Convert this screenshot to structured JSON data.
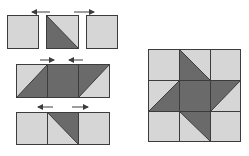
{
  "diagram": {
    "colors": {
      "light": "#d6d6d6",
      "dark": "#6a6a6a",
      "stroke": "#3c3c3c",
      "arrow": "#3c3c3c"
    },
    "assembly_rows": [
      {
        "row": 1,
        "units": [
          "light-square",
          "half-square-triangle (dark lower-left, light upper-right)",
          "light-square"
        ],
        "arrows": [
          "left",
          "right"
        ],
        "note": "separated units"
      },
      {
        "row": 2,
        "units": [
          "half-square-triangle (light upper-left, dark lower-right)",
          "dark-square",
          "half-square-triangle (dark upper-left, light lower-right)"
        ],
        "arrows": [
          "right",
          "left"
        ],
        "note": "joined row"
      },
      {
        "row": 3,
        "units": [
          "light-square",
          "half-square-triangle (dark upper-right, light lower-left)",
          "light-square"
        ],
        "arrows": [
          "left",
          "right"
        ],
        "note": "joined row"
      }
    ],
    "finished_block": {
      "grid": "3x3",
      "description": "Finished block with dark center square and four dark triangle points forming a pinwheel star"
    }
  }
}
